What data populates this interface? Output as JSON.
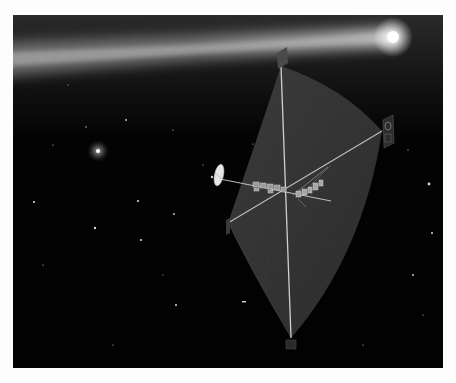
{
  "image": {
    "description": "Artist illustration of a solar sail spacecraft with a bright comet streaking across a starfield",
    "background_color": "#020202",
    "border_color": "#fdfdfd"
  },
  "comet": {
    "nucleus": {
      "x": 380,
      "y": 22
    },
    "tail_start": {
      "x": 0,
      "y": 40
    },
    "color": "#ffffff"
  },
  "bright_star": {
    "x": 85,
    "y": 136
  },
  "sail": {
    "color": "#3a3a3a",
    "corners": {
      "top": {
        "x": 268,
        "y": 51
      },
      "right": {
        "x": 369,
        "y": 116
      },
      "left": {
        "x": 215,
        "y": 208
      },
      "bottom": {
        "x": 278,
        "y": 323
      }
    }
  },
  "spacecraft": {
    "dish": {
      "x": 205,
      "y": 160
    },
    "boom_end": {
      "x": 318,
      "y": 186
    }
  },
  "stars": [
    {
      "x": 21,
      "y": 187
    },
    {
      "x": 82,
      "y": 213
    },
    {
      "x": 125,
      "y": 186
    },
    {
      "x": 128,
      "y": 225
    },
    {
      "x": 161,
      "y": 199
    },
    {
      "x": 163,
      "y": 290
    },
    {
      "x": 231,
      "y": 287
    },
    {
      "x": 416,
      "y": 169
    },
    {
      "x": 419,
      "y": 218
    },
    {
      "x": 400,
      "y": 260
    },
    {
      "x": 113,
      "y": 105
    },
    {
      "x": 73,
      "y": 112
    },
    {
      "x": 40,
      "y": 130
    },
    {
      "x": 160,
      "y": 115
    },
    {
      "x": 240,
      "y": 129
    },
    {
      "x": 30,
      "y": 250
    },
    {
      "x": 350,
      "y": 330
    },
    {
      "x": 100,
      "y": 330
    },
    {
      "x": 190,
      "y": 150
    },
    {
      "x": 410,
      "y": 300
    },
    {
      "x": 55,
      "y": 70
    },
    {
      "x": 150,
      "y": 260
    },
    {
      "x": 395,
      "y": 135
    }
  ]
}
